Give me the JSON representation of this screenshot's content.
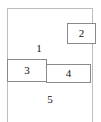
{
  "diagram": {
    "type": "layout-wireframe",
    "canvas": {
      "width": 101,
      "height": 122,
      "background": "#ffffff"
    },
    "outer_container": {
      "name": "outer-container",
      "border_color": "#bdbdbd",
      "open_bottom": true
    },
    "regions": [
      {
        "id": "1",
        "label": "1",
        "kind": "free-region",
        "position": "upper-left-area"
      },
      {
        "id": "5",
        "label": "5",
        "kind": "free-region",
        "position": "lower-area"
      }
    ],
    "boxes": [
      {
        "id": "2",
        "label": "2",
        "kind": "bordered-box",
        "position": "top-right",
        "border_color": "#8a8a8a"
      },
      {
        "id": "3",
        "label": "3",
        "kind": "bordered-box",
        "position": "middle-left",
        "border_color": "#8a8a8a"
      },
      {
        "id": "4",
        "label": "4",
        "kind": "bordered-box",
        "position": "middle-right",
        "border_color": "#8a8a8a"
      }
    ]
  }
}
